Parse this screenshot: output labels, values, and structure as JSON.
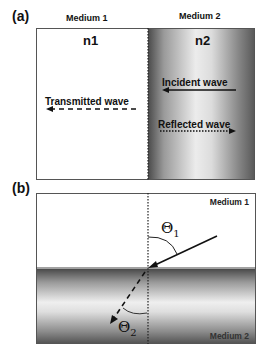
{
  "panel_a": {
    "label": "(a)",
    "medium1_header": "Medium 1",
    "medium2_header": "Medium 2",
    "n1": "n1",
    "n2": "n2",
    "incident_label": "Incident wave",
    "transmitted_label": "Transmitted wave",
    "reflected_label": "Reflected wave"
  },
  "panel_b": {
    "label": "(b)",
    "medium1_label": "Medium 1",
    "medium2_label": "Medium 2",
    "theta1": "Θ",
    "theta1_sub": "1",
    "theta2": "Θ",
    "theta2_sub": "2"
  },
  "colors": {
    "line": "#111111",
    "border": "#555555",
    "gradient_dark": "#4a4a4a",
    "gradient_light": "#ececec"
  }
}
